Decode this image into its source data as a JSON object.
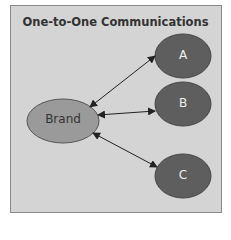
{
  "diagram": {
    "title": "One-to-One Communications",
    "colors": {
      "background": "#d4d4d4",
      "brand_fill": "#9a9a9a",
      "node_fill": "#5e5e5e",
      "arrow": "#222222"
    },
    "center_node": {
      "label": "Brand"
    },
    "nodes": [
      {
        "label": "A"
      },
      {
        "label": "B"
      },
      {
        "label": "C"
      }
    ],
    "edges": [
      {
        "from": "Brand",
        "to": "A",
        "type": "bidirectional"
      },
      {
        "from": "Brand",
        "to": "B",
        "type": "bidirectional"
      },
      {
        "from": "Brand",
        "to": "C",
        "type": "bidirectional"
      }
    ]
  }
}
